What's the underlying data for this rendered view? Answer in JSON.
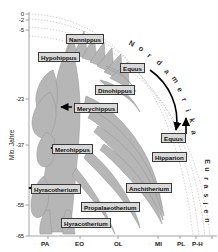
{
  "figure": {
    "axis_title_y": "Mio. Jahre",
    "region_north_america": "Nordamerika",
    "region_eurasia": "Eurasien"
  },
  "chart_data": {
    "type": "diagram",
    "ylabel": "Mio. Jahre",
    "xlabel": "",
    "ylim": [
      -65,
      0
    ],
    "grid": "dotted-arcs",
    "legend": "none",
    "y_ticks": [
      {
        "label": "0",
        "value": 0
      },
      {
        "label": "-2",
        "value": -2
      },
      {
        "label": "-5",
        "value": -5
      },
      {
        "label": "-23",
        "value": -23
      },
      {
        "label": "-37",
        "value": -37
      },
      {
        "label": "-55",
        "value": -55
      },
      {
        "label": "-65",
        "value": -65
      }
    ],
    "x_ticks": [
      {
        "label": "PA"
      },
      {
        "label": "EO"
      },
      {
        "label": "OL"
      },
      {
        "label": "MI"
      },
      {
        "label": "PL"
      },
      {
        "label": "P-H"
      }
    ],
    "annotations": [
      {
        "text": "Nordamerika",
        "position": "top-right-arc"
      },
      {
        "text": "Eurasien",
        "position": "right-vertical"
      }
    ],
    "taxa": [
      {
        "name": "Nannippus",
        "age_ma": -5,
        "region": "Nordamerika",
        "arrow": "none"
      },
      {
        "name": "Hypohippus",
        "age_ma": -8,
        "region": "Nordamerika",
        "arrow": "none"
      },
      {
        "name": "Equus",
        "age_ma": -12,
        "region": "Nordamerika",
        "arrow": "migration-source"
      },
      {
        "name": "Dinohippus",
        "age_ma": -19,
        "region": "Nordamerika",
        "arrow": "none"
      },
      {
        "name": "Merychippus",
        "age_ma": -26,
        "region": "Nordamerika",
        "arrow": "left"
      },
      {
        "name": "Equus",
        "age_ma": -37,
        "region": "Eurasien",
        "arrow": "migration-target"
      },
      {
        "name": "Hipparion",
        "age_ma": -42,
        "region": "Eurasien",
        "arrow": "up"
      },
      {
        "name": "Merohippus",
        "age_ma": -38,
        "region": "Nordamerika",
        "arrow": "left"
      },
      {
        "name": "Hyracotherium",
        "age_ma": -50,
        "region": "Nordamerika",
        "arrow": "left"
      },
      {
        "name": "Anchitherium",
        "age_ma": -51,
        "region": "Eurasien",
        "arrow": "none"
      },
      {
        "name": "Propalaeotherium",
        "age_ma": -57,
        "region": "Eurasien",
        "arrow": "none"
      },
      {
        "name": "Hyracotherium",
        "age_ma": -61,
        "region": "Nordamerika",
        "arrow": "none"
      }
    ],
    "colors": {
      "clade_fill": "#b6b6b6",
      "clade_stroke": "#8d8d8d",
      "label_fill": "#d9d9d9",
      "label_stroke": "#3a3a3a",
      "arrow": "#000000",
      "axis": "#9a9a9a",
      "grid_arc": "#bdbdbd"
    }
  }
}
